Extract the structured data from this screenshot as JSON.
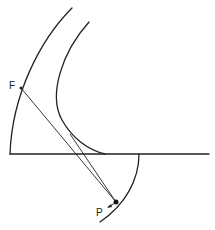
{
  "diagram": {
    "labels": {
      "focus": "F",
      "point": "P"
    },
    "colors": {
      "stroke": "#222222",
      "background": "#ffffff"
    },
    "elements": [
      {
        "name": "outer-arc",
        "type": "arc"
      },
      {
        "name": "inner-curve",
        "type": "hyperbola-branch"
      },
      {
        "name": "axis-line",
        "type": "line"
      },
      {
        "name": "lower-arc",
        "type": "arc"
      },
      {
        "name": "ray-from-focus",
        "type": "line"
      },
      {
        "name": "tangent-ray",
        "type": "line"
      },
      {
        "name": "point-p",
        "type": "point"
      },
      {
        "name": "point-f",
        "type": "point"
      }
    ]
  }
}
